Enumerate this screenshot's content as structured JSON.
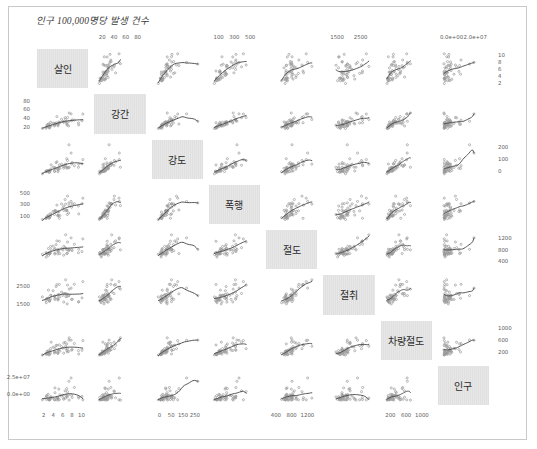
{
  "figure": {
    "title": "인구 100,000명당 발생 건수",
    "border_color": "#c9c9c9",
    "point_color": "#9a9a9a",
    "smooth_color": "#4d4d4d",
    "diag_bg": "#e3e3e3",
    "n_vars": 8
  },
  "chart_data": {
    "type": "scatter",
    "title": "인구 100,000명당 발생 건수",
    "plot_kind": "scatterplot-matrix",
    "grid": false,
    "legend": "none",
    "variables": [
      {
        "index": 1,
        "label": "살인",
        "axis_side": "bottom",
        "ticks": [
          "2",
          "4",
          "6",
          "8",
          "10"
        ],
        "range": [
          1,
          11
        ]
      },
      {
        "index": 2,
        "label": "강간",
        "axis_side": "left",
        "ticks": [
          "20",
          "40",
          "60",
          "80"
        ],
        "range": [
          10,
          90
        ]
      },
      {
        "index": 3,
        "label": "강도",
        "axis_side": "bottom",
        "ticks": [
          "0",
          "50",
          "150",
          "250"
        ],
        "range": [
          0,
          280
        ]
      },
      {
        "index": 4,
        "label": "폭행",
        "axis_side": "left",
        "ticks": [
          "100",
          "300",
          "500"
        ],
        "range": [
          50,
          560
        ]
      },
      {
        "index": 5,
        "label": "절도",
        "axis_side": "bottom",
        "ticks": [
          "400",
          "800",
          "1200"
        ],
        "range": [
          350,
          1400
        ]
      },
      {
        "index": 6,
        "label": "절취",
        "axis_side": "left",
        "ticks": [
          "1500",
          "2500"
        ],
        "range": [
          1000,
          3200
        ]
      },
      {
        "index": 7,
        "label": "차량절도",
        "axis_side": "bottom",
        "ticks": [
          "200",
          "600",
          "1000"
        ],
        "range": [
          100,
          1200
        ]
      },
      {
        "index": 8,
        "label": "인구",
        "axis_side": "left",
        "ticks": [
          "0.0e+00",
          "2.5e+07"
        ],
        "range": [
          0,
          28000000
        ]
      }
    ],
    "top_axes": [
      {
        "column": 2,
        "ticks": [
          "20",
          "40",
          "60",
          "80"
        ]
      },
      {
        "column": 4,
        "ticks": [
          "100",
          "300",
          "500"
        ]
      },
      {
        "column": 6,
        "ticks": [
          "1500",
          "2500"
        ]
      },
      {
        "column": 8,
        "ticks": [
          "0.0e+00",
          "2.0e+07"
        ]
      }
    ],
    "right_axes": [
      {
        "row": 1,
        "ticks": [
          "10",
          "8",
          "6",
          "4",
          "2"
        ]
      },
      {
        "row": 3,
        "ticks": [
          "200",
          "100",
          "0"
        ]
      },
      {
        "row": 5,
        "ticks": [
          "1200",
          "800",
          "400"
        ]
      },
      {
        "row": 7,
        "ticks": [
          "1000",
          "600",
          "200"
        ]
      }
    ],
    "left_axes": [
      {
        "row": 2,
        "ticks": [
          "80",
          "60",
          "40",
          "20"
        ]
      },
      {
        "row": 4,
        "ticks": [
          "500",
          "300",
          "100"
        ]
      },
      {
        "row": 6,
        "ticks": [
          "2500",
          "1500"
        ]
      },
      {
        "row": 8,
        "ticks": [
          "2.5e+07",
          "0.0e+00"
        ]
      }
    ],
    "bottom_axes": [
      {
        "column": 1,
        "ticks": [
          "2",
          "4",
          "6",
          "8",
          "10"
        ]
      },
      {
        "column": 3,
        "ticks": [
          "0",
          "50",
          "150",
          "250"
        ]
      },
      {
        "column": 5,
        "ticks": [
          "400",
          "800",
          "1200"
        ]
      },
      {
        "column": 7,
        "ticks": [
          "200",
          "600",
          "1000"
        ]
      }
    ],
    "observations": [
      {
        "살인": 14.2,
        "강간": 25.2,
        "강도": 96.8,
        "폭행": 278.3,
        "절도": 1135.5,
        "절취": 1881.9,
        "차량절도": 280.7,
        "인구": 3615000
      },
      {
        "살인": 10.8,
        "강간": 51.6,
        "강도": 96.8,
        "폭행": 284.0,
        "절도": 1331.7,
        "절취": 3369.8,
        "차량절도": 753.3,
        "인구": 365000
      },
      {
        "살인": 9.5,
        "강간": 34.2,
        "강도": 138.2,
        "폭행": 312.3,
        "절도": 2346.1,
        "절취": 4467.4,
        "차량절도": 439.5,
        "인구": 2212000
      },
      {
        "살인": 8.8,
        "강간": 27.6,
        "강도": 83.2,
        "폭행": 203.4,
        "절도": 972.6,
        "절취": 1862.1,
        "차량절도": 183.4,
        "인구": 2110000
      },
      {
        "살인": 11.5,
        "강간": 49.4,
        "강도": 287.0,
        "폭행": 358.0,
        "절도": 2139.4,
        "절취": 3499.8,
        "차량절도": 664.5,
        "인구": 21198000
      },
      {
        "살인": 6.3,
        "강간": 42.0,
        "강도": 170.7,
        "폭행": 292.9,
        "절도": 1935.2,
        "절취": 3903.2,
        "차량절도": 477.1,
        "인구": 2541000
      },
      {
        "살인": 4.2,
        "강간": 16.8,
        "강도": 129.5,
        "폭행": 131.8,
        "절도": 1346.0,
        "절취": 2620.7,
        "차량절도": 593.2,
        "인구": 3100000
      },
      {
        "살인": 6.0,
        "강간": 24.9,
        "강도": 157.0,
        "폭행": 194.2,
        "절도": 1682.6,
        "절취": 3678.4,
        "차량절도": 467.0,
        "인구": 579000
      },
      {
        "살인": 10.2,
        "강간": 39.6,
        "강도": 187.9,
        "폭행": 449.1,
        "절도": 1859.9,
        "절취": 3840.5,
        "차량절도": 351.4,
        "인구": 8277000
      },
      {
        "살인": 11.7,
        "강간": 31.1,
        "강도": 140.5,
        "폭행": 256.5,
        "절도": 1351.1,
        "절취": 2170.2,
        "차량절도": 297.9,
        "인구": 4931000
      },
      {
        "살인": 7.2,
        "강간": 25.5,
        "강도": 128.0,
        "폭행": 64.1,
        "절도": 1911.5,
        "절취": 3920.4,
        "차량절도": 489.4,
        "인구": 868000
      },
      {
        "살인": 5.5,
        "강간": 19.4,
        "강도": 39.6,
        "폭행": 172.5,
        "절도": 1050.8,
        "절취": 2599.6,
        "차량절도": 237.6,
        "인구": 813000
      },
      {
        "살인": 9.9,
        "강간": 21.8,
        "강도": 211.3,
        "폭행": 209.0,
        "절도": 1085.0,
        "절취": 2828.5,
        "차량절도": 528.6,
        "인구": 11197000
      },
      {
        "살인": 7.4,
        "강간": 26.5,
        "강도": 82.0,
        "폭행": 113.2,
        "절도": 1078.0,
        "절취": 2498.7,
        "차량절도": 258.0,
        "인구": 5313000
      },
      {
        "살인": 2.3,
        "강간": 10.6,
        "강도": 45.5,
        "폭행": 56.6,
        "절도": 1140.5,
        "절취": 2038.5,
        "차량절도": 148.9,
        "인구": 2861000
      },
      {
        "살인": 6.6,
        "강간": 22.0,
        "강도": 66.1,
        "폭행": 115.6,
        "절도": 1062.2,
        "절취": 2677.1,
        "차량절도": 194.0,
        "인구": 2280000
      },
      {
        "살인": 10.1,
        "강간": 19.1,
        "강도": 95.7,
        "폭행": 130.7,
        "절도": 1093.3,
        "절취": 1653.2,
        "차량절도": 231.9,
        "인구": 3387000
      },
      {
        "살인": 15.5,
        "강간": 30.9,
        "강도": 142.9,
        "폭행": 318.8,
        "절도": 1216.0,
        "절취": 2354.6,
        "차량절도": 289.9,
        "인구": 3806000
      },
      {
        "살인": 2.4,
        "강간": 13.5,
        "강도": 36.5,
        "폭행": 76.3,
        "절도": 853.3,
        "절취": 1790.4,
        "차량절도": 177.5,
        "인구": 1058000
      },
      {
        "살인": 8.0,
        "강간": 34.8,
        "강도": 137.8,
        "폭행": 314.4,
        "절도": 1419.4,
        "절취": 3031.2,
        "차량절도": 428.8,
        "인구": 4122000
      },
      {
        "살인": 3.1,
        "강간": 20.8,
        "강도": 53.3,
        "폭행": 101.6,
        "절도": 1114.8,
        "절취": 2160.8,
        "차량절도": 211.5,
        "인구": 5814000
      },
      {
        "살인": 9.3,
        "강간": 38.9,
        "강도": 123.4,
        "폭행": 390.3,
        "절도": 1481.6,
        "절취": 2860.1,
        "차량절도": 589.5,
        "인구": 9111000
      },
      {
        "살인": 2.7,
        "강간": 19.5,
        "강도": 50.0,
        "폭행": 99.7,
        "절도": 1037.6,
        "절취": 2263.0,
        "차량절도": 255.0,
        "인구": 3921000
      },
      {
        "살인": 14.3,
        "강간": 19.6,
        "강도": 138.9,
        "폭행": 140.5,
        "절도": 1370.5,
        "절취": 1913.5,
        "차량절도": 152.5,
        "인구": 2341000
      },
      {
        "살인": 9.6,
        "강간": 28.3,
        "강도": 102.0,
        "폭행": 196.9,
        "절도": 1426.2,
        "절취": 2507.4,
        "차량절도": 344.3,
        "인구": 4767000
      },
      {
        "살인": 5.4,
        "강간": 16.9,
        "강도": 45.8,
        "폭행": 130.2,
        "절도": 1357.7,
        "절취": 2526.8,
        "차량절도": 192.0,
        "인구": 746000
      },
      {
        "살인": 3.9,
        "강간": 20.2,
        "강도": 50.7,
        "폭행": 99.3,
        "절도": 1110.4,
        "절취": 2217.2,
        "차량절도": 184.1,
        "인구": 1544000
      },
      {
        "살인": 15.8,
        "강간": 48.9,
        "강도": 199.5,
        "폭행": 413.8,
        "절도": 2069.1,
        "절취": 4253.7,
        "차량절도": 651.5,
        "인구": 590000
      },
      {
        "살인": 3.2,
        "강간": 14.6,
        "강도": 33.7,
        "폭행": 71.6,
        "절도": 961.0,
        "절취": 2349.6,
        "차량절도": 130.2,
        "인구": 812000
      },
      {
        "살인": 5.6,
        "강간": 23.9,
        "강도": 93.8,
        "폭행": 200.1,
        "절도": 1421.0,
        "절취": 2165.1,
        "차량절도": 368.5,
        "인구": 7333000
      },
      {
        "살인": 8.8,
        "강간": 26.9,
        "강도": 107.2,
        "폭행": 276.4,
        "절도": 1571.0,
        "절취": 2861.8,
        "차량절도": 556.4,
        "인구": 1144000
      },
      {
        "살인": 10.7,
        "강간": 29.3,
        "강도": 397.9,
        "폭행": 331.3,
        "절도": 1369.0,
        "절취": 2619.8,
        "차량절도": 669.1,
        "인구": 18076000
      },
      {
        "살인": 10.6,
        "강간": 17.0,
        "강도": 90.4,
        "폭행": 155.5,
        "절도": 1273.0,
        "절취": 2656.6,
        "차량절도": 247.5,
        "인구": 5441000
      },
      {
        "살인": 1.0,
        "강간": 10.0,
        "강도": 9.0,
        "폭행": 44.0,
        "절도": 1026.0,
        "절취": 2464.0,
        "차량절도": 116.0,
        "인구": 637000
      },
      {
        "살인": 7.0,
        "강간": 27.4,
        "강도": 83.9,
        "폭행": 180.4,
        "절도": 1332.0,
        "절취": 2760.1,
        "차량절도": 314.9,
        "인구": 10735000
      },
      {
        "살인": 6.6,
        "강간": 20.8,
        "강도": 83.0,
        "폭행": 174.1,
        "절도": 1351.6,
        "절취": 2316.8,
        "차량절도": 226.1,
        "인구": 2715000
      },
      {
        "살인": 4.9,
        "강간": 24.5,
        "강도": 97.3,
        "폭행": 184.5,
        "절도": 1576.7,
        "절취": 3190.5,
        "차량절도": 407.6,
        "인구": 2284000
      },
      {
        "살인": 5.6,
        "강간": 20.8,
        "강도": 80.2,
        "폭행": 190.5,
        "절도": 1121.6,
        "절취": 2301.5,
        "차량절도": 231.8,
        "인구": 11860000
      },
      {
        "살인": 3.7,
        "강간": 15.6,
        "강도": 52.3,
        "폭행": 100.6,
        "절도": 1088.1,
        "절취": 2065.6,
        "차량절도": 267.4,
        "인구": 931000
      },
      {
        "살인": 11.9,
        "강간": 33.2,
        "강도": 159.8,
        "폭행": 314.7,
        "절도": 1276.9,
        "절취": 2189.1,
        "차량절도": 319.1,
        "인구": 2816000
      },
      {
        "살인": 3.6,
        "강간": 12.7,
        "강도": 30.6,
        "폭행": 70.5,
        "절도": 1052.6,
        "절취": 1943.4,
        "차량절도": 165.7,
        "인구": 681000
      },
      {
        "살인": 10.0,
        "강간": 25.1,
        "강도": 83.1,
        "폭행": 198.4,
        "절도": 1338.4,
        "절취": 2500.8,
        "차량절도": 279.9,
        "인구": 4173000
      },
      {
        "살인": 12.7,
        "강간": 32.5,
        "강도": 117.6,
        "폭행": 318.3,
        "절도": 1705.6,
        "절취": 3937.0,
        "차량절도": 542.4,
        "인구": 12237000
      },
      {
        "살인": 3.2,
        "강간": 22.2,
        "강도": 47.7,
        "폭행": 120.6,
        "절도": 1420.6,
        "절취": 3257.4,
        "차량절도": 274.8,
        "인구": 1203000
      },
      {
        "살인": 3.6,
        "강간": 11.2,
        "강도": 30.0,
        "폭행": 74.6,
        "절도": 1154.8,
        "절취": 2011.2,
        "차량절도": 128.0,
        "인구": 472000
      },
      {
        "살인": 8.5,
        "강간": 28.3,
        "강도": 111.7,
        "폭행": 241.2,
        "절도": 1320.7,
        "절취": 2656.5,
        "차량절도": 370.1,
        "인구": 4981000
      },
      {
        "살인": 4.0,
        "강간": 26.9,
        "강도": 70.8,
        "폭행": 147.3,
        "절도": 1562.9,
        "절취": 2650.2,
        "차량절도": 354.9,
        "인구": 3559000
      },
      {
        "살인": 6.7,
        "강간": 17.1,
        "강도": 37.5,
        "폭행": 107.1,
        "절도": 1260.9,
        "절취": 2105.9,
        "차량절도": 173.4,
        "인구": 1799000
      },
      {
        "살인": 2.5,
        "강간": 14.9,
        "강도": 40.6,
        "폭행": 73.0,
        "절도": 1103.3,
        "절취": 2251.1,
        "차량절도": 147.8,
        "인구": 4589000
      },
      {
        "살인": 6.8,
        "강간": 21.9,
        "강도": 60.3,
        "폭행": 118.0,
        "절도": 1206.2,
        "절취": 2189.3,
        "차량절도": 302.7,
        "인구": 376000
      }
    ]
  }
}
